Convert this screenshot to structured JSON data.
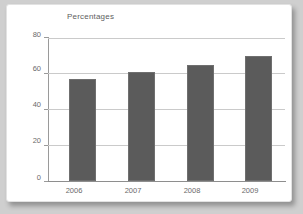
{
  "chart_data": {
    "type": "bar",
    "title": "Percentages",
    "xlabel": "",
    "ylabel": "",
    "categories": [
      "2006",
      "2007",
      "2008",
      "2009"
    ],
    "values": [
      57,
      61,
      65,
      70
    ],
    "ylim": [
      0,
      80
    ],
    "yticks": [
      "0",
      "20",
      "40",
      "60",
      "80"
    ],
    "ytick_values": [
      0,
      20,
      40,
      60,
      80
    ],
    "grid": true,
    "legend": "none",
    "series": [
      {
        "name": "Percentages",
        "values": [
          57,
          61,
          65,
          70
        ]
      }
    ],
    "colors": {
      "bar_fill": "#5b5b5b",
      "bar_stroke": "#6f6f6f",
      "gridline": "#cacaca",
      "axis": "#8e8e8e",
      "text": "#6a6a6a",
      "title_text": "#5e5e5e",
      "card_background": "#ffffff",
      "page_background": "#cfcfcf"
    }
  }
}
